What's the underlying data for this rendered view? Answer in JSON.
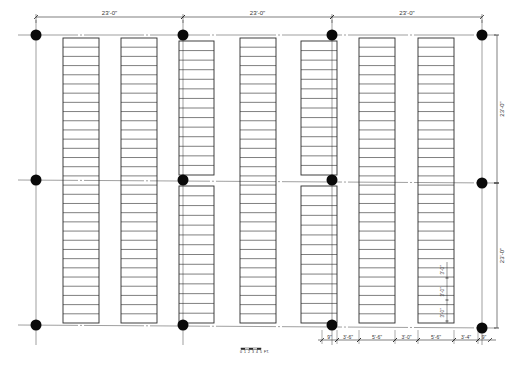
{
  "drawing": {
    "type": "library stack floor plan",
    "colors": {
      "line": "#2a2a2a",
      "grid": "#777777",
      "column": "#0a0a0a",
      "background": "#ffffff"
    }
  },
  "grid": {
    "columns_x": [
      36,
      183,
      332,
      482
    ],
    "rows_y_left": [
      35,
      180,
      325
    ],
    "rows_y_right": [
      35,
      183,
      328
    ]
  },
  "dimensions": {
    "top": [
      {
        "label": "23'-0\"",
        "x1": 36,
        "x2": 183
      },
      {
        "label": "23'-0\"",
        "x1": 183,
        "x2": 332
      },
      {
        "label": "23'-0\"",
        "x1": 332,
        "x2": 482
      }
    ],
    "right": [
      {
        "label": "23'-0\"",
        "y1": 35,
        "y2": 183
      },
      {
        "label": "23'-0\"",
        "y1": 183,
        "y2": 328
      }
    ],
    "bottom": [
      {
        "label": "9\"",
        "x1": 322,
        "x2": 337
      },
      {
        "label": "3'-6\"",
        "x1": 337,
        "x2": 359
      },
      {
        "label": "5'-6\"",
        "x1": 359,
        "x2": 395
      },
      {
        "label": "3'-0\"",
        "x1": 395,
        "x2": 418
      },
      {
        "label": "5'-6\"",
        "x1": 418,
        "x2": 454
      },
      {
        "label": "3'-4\"",
        "x1": 454,
        "x2": 478
      },
      {
        "label": "9\"",
        "x1": 478,
        "x2": 490
      }
    ],
    "shelf_spacing": [
      {
        "label": "3'-0\"",
        "y": 270
      },
      {
        "label": "3'-0\"",
        "y": 292
      },
      {
        "label": "3'-0\"",
        "y": 313
      }
    ]
  },
  "stacks": [
    {
      "id": "S1",
      "x": 63,
      "w": 36,
      "segments": [
        {
          "y": 38,
          "h": 285,
          "rows": 31
        }
      ]
    },
    {
      "id": "S2",
      "x": 121,
      "w": 36,
      "segments": [
        {
          "y": 38,
          "h": 285,
          "rows": 31
        }
      ]
    },
    {
      "id": "S3",
      "x": 179,
      "w": 35,
      "segments": [
        {
          "y": 41,
          "h": 134,
          "rows": 14
        },
        {
          "y": 186,
          "h": 137,
          "rows": 14
        }
      ]
    },
    {
      "id": "S4",
      "x": 240,
      "w": 36,
      "segments": [
        {
          "y": 38,
          "h": 285,
          "rows": 31
        }
      ]
    },
    {
      "id": "S5",
      "x": 301,
      "w": 36,
      "segments": [
        {
          "y": 41,
          "h": 134,
          "rows": 14
        },
        {
          "y": 186,
          "h": 137,
          "rows": 14
        }
      ]
    },
    {
      "id": "S6",
      "x": 359,
      "w": 36,
      "segments": [
        {
          "y": 38,
          "h": 285,
          "rows": 31
        }
      ]
    },
    {
      "id": "S7",
      "x": 418,
      "w": 36,
      "segments": [
        {
          "y": 38,
          "h": 285,
          "rows": 31
        }
      ]
    }
  ],
  "scale_bar": {
    "ticks": [
      "0",
      "1",
      "2",
      "3",
      "4",
      "5"
    ],
    "unit": "FT.",
    "x": 241,
    "y": 351
  }
}
